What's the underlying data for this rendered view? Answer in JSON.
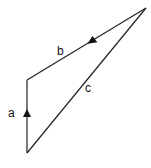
{
  "diagram": {
    "type": "vector-triangle",
    "vertices": {
      "top_right": [
        146,
        8
      ],
      "top_left": [
        27,
        80
      ],
      "bottom": [
        27,
        153
      ]
    },
    "vectors": [
      {
        "label": "a",
        "from": "bottom",
        "to": "top_left",
        "arrow": "up",
        "arrow_pos": [
          27,
          114
        ],
        "label_pos": [
          9,
          117
        ]
      },
      {
        "label": "b",
        "from": "top_right",
        "to": "top_left",
        "arrow": "down-left",
        "arrow_pos": [
          92,
          40
        ],
        "label_pos": [
          57,
          55
        ]
      },
      {
        "label": "c",
        "from": "bottom",
        "to": "top_right",
        "arrow": "none",
        "label_pos": [
          85,
          92
        ]
      }
    ],
    "line_color": "#222222"
  }
}
